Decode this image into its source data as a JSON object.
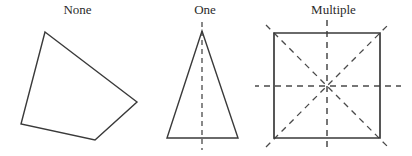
{
  "figure": {
    "title": "",
    "background_color": "#ffffff",
    "width": 412,
    "height": 156,
    "shape_stroke_color": "#3a3a3a",
    "symmetry_line_color": "#4a4a4a"
  },
  "panels": [
    {
      "label": "None",
      "shape_name": "irregular-quadrilateral",
      "symmetry_line_count": 0,
      "vertices": "45,32 137,102 95,140 21,124",
      "symmetry_lines": []
    },
    {
      "label": "One",
      "shape_name": "isosceles-triangle",
      "symmetry_line_count": 1,
      "vertices": "47,31 83,138 12,138",
      "symmetry_lines": [
        {
          "name": "vertical-axis",
          "x1": 47,
          "y1": 22,
          "x2": 47,
          "y2": 150
        }
      ]
    },
    {
      "label": "Multiple",
      "shape_name": "square",
      "symmetry_line_count": 4,
      "vertices": "19,33 125,33 125,138 19,138",
      "symmetry_lines": [
        {
          "name": "vertical-axis",
          "x1": 72,
          "y1": 20,
          "x2": 72,
          "y2": 151
        },
        {
          "name": "horizontal-axis",
          "x1": -2,
          "y1": 86,
          "x2": 146,
          "y2": 86
        },
        {
          "name": "diagonal-axis-nw-se",
          "x1": 11,
          "y1": 25,
          "x2": 133,
          "y2": 147
        },
        {
          "name": "diagonal-axis-sw-ne",
          "x1": 11,
          "y1": 147,
          "x2": 133,
          "y2": 25
        }
      ]
    }
  ]
}
